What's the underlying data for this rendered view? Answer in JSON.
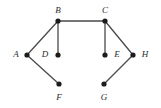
{
  "figure": {
    "kind": "undirected-graph-diagram",
    "background_color": "#ffffff",
    "width": 161,
    "height": 108,
    "edge_color": "#4a4a4a",
    "vertex_color": "#1c1c1c",
    "label_color": "#2b2b2b"
  },
  "graph": {
    "vertices": [
      {
        "id": "A",
        "label": "A",
        "x": 27,
        "y": 55,
        "label_x": 16,
        "label_y": 54,
        "label_pos": "left"
      },
      {
        "id": "B",
        "label": "B",
        "x": 58,
        "y": 21,
        "label_x": 58,
        "label_y": 10,
        "label_pos": "above"
      },
      {
        "id": "C",
        "label": "C",
        "x": 105,
        "y": 21,
        "label_x": 105,
        "label_y": 10,
        "label_pos": "above"
      },
      {
        "id": "D",
        "label": "D",
        "x": 58,
        "y": 55,
        "label_x": 45,
        "label_y": 54,
        "label_pos": "left"
      },
      {
        "id": "E",
        "label": "E",
        "x": 105,
        "y": 55,
        "label_x": 117,
        "label_y": 54,
        "label_pos": "right"
      },
      {
        "id": "F",
        "label": "F",
        "x": 59,
        "y": 84,
        "label_x": 59,
        "label_y": 97,
        "label_pos": "below"
      },
      {
        "id": "G",
        "label": "G",
        "x": 104,
        "y": 84,
        "label_x": 104,
        "label_y": 97,
        "label_pos": "below"
      },
      {
        "id": "H",
        "label": "H",
        "x": 133,
        "y": 55,
        "label_x": 145,
        "label_y": 54,
        "label_pos": "right"
      }
    ],
    "vertex_radius": 2.6,
    "edges": [
      {
        "id": "edge-A-B",
        "from": "A",
        "to": "B"
      },
      {
        "id": "edge-A-F",
        "from": "A",
        "to": "F"
      },
      {
        "id": "edge-B-C",
        "from": "B",
        "to": "C"
      },
      {
        "id": "edge-B-D",
        "from": "B",
        "to": "D"
      },
      {
        "id": "edge-C-E",
        "from": "C",
        "to": "E"
      },
      {
        "id": "edge-C-H",
        "from": "C",
        "to": "H"
      },
      {
        "id": "edge-G-H",
        "from": "G",
        "to": "H"
      }
    ]
  }
}
